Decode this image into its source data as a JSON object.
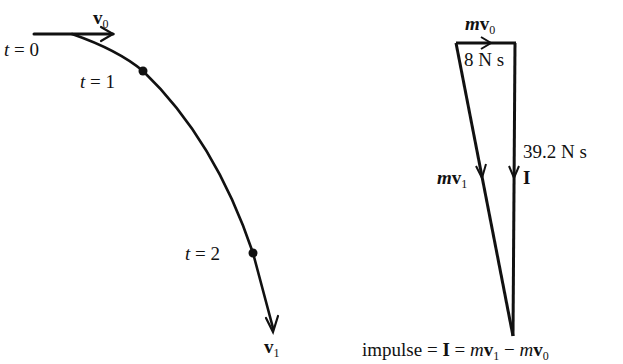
{
  "trajectory": {
    "labels": {
      "t0": {
        "var": "t",
        "eq": " = ",
        "val": "0"
      },
      "t1": {
        "var": "t",
        "eq": " = ",
        "val": "1"
      },
      "t2": {
        "var": "t",
        "eq": " = ",
        "val": "2"
      },
      "v0": {
        "sym": "v",
        "sub": "0"
      },
      "v1": {
        "sym": "v",
        "sub": "1"
      }
    }
  },
  "vector_triangle": {
    "mv0": {
      "m": "m",
      "sym": "v",
      "sub": "0"
    },
    "mv0_value": "8 N s",
    "impulse_value": "39.2 N s",
    "impulse_symbol": "I",
    "mv1": {
      "m": "m",
      "sym": "v",
      "sub": "1"
    }
  },
  "equation": {
    "word": "impulse",
    "eq1": " = ",
    "I": "I",
    "eq2": " = ",
    "m1": "m",
    "v1": "v",
    "sub1": "1",
    "minus": " − ",
    "m0": "m",
    "v0": "v",
    "sub0": "0"
  },
  "colors": {
    "stroke": "#111111",
    "background": "#ffffff"
  }
}
